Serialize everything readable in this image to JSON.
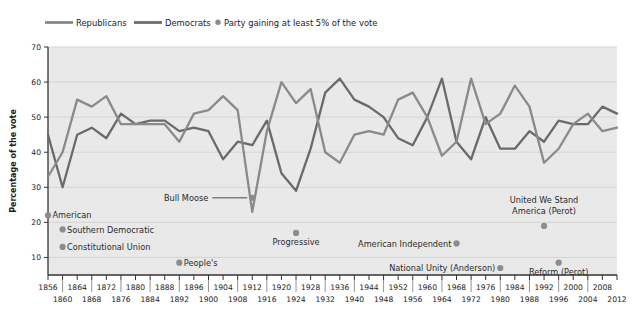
{
  "chart_data": {
    "type": "line",
    "title": "",
    "xlabel": "",
    "ylabel": "Percentage of the vote",
    "ylim": [
      5,
      70
    ],
    "yticks": [
      10,
      20,
      30,
      40,
      50,
      60,
      70
    ],
    "xlim": [
      1856,
      2012
    ],
    "grid": true,
    "legend_position": "top-left",
    "legend": [
      {
        "name": "Republicans",
        "kind": "line",
        "color": "#808080"
      },
      {
        "name": "Democrats",
        "kind": "line",
        "color": "#6e6e6e"
      },
      {
        "name": "Party gaining at least 5% of the vote",
        "kind": "dot",
        "color": "#8c8c8c"
      }
    ],
    "xticks_top": [
      1856,
      1864,
      1872,
      1880,
      1888,
      1896,
      1904,
      1912,
      1920,
      1928,
      1936,
      1944,
      1952,
      1960,
      1968,
      1976,
      1984,
      1992,
      2000,
      2008
    ],
    "xticks_bottom": [
      1860,
      1868,
      1876,
      1884,
      1892,
      1900,
      1908,
      1916,
      1924,
      1932,
      1940,
      1948,
      1956,
      1964,
      1972,
      1980,
      1988,
      1996,
      2004,
      2012
    ],
    "x": [
      1856,
      1860,
      1864,
      1868,
      1872,
      1876,
      1880,
      1884,
      1888,
      1892,
      1896,
      1900,
      1904,
      1908,
      1912,
      1916,
      1920,
      1924,
      1928,
      1932,
      1936,
      1940,
      1944,
      1948,
      1952,
      1956,
      1960,
      1964,
      1968,
      1972,
      1976,
      1980,
      1984,
      1988,
      1992,
      1996,
      2000,
      2004,
      2008,
      2012
    ],
    "series": [
      {
        "name": "Republicans",
        "color": "#8a8a8a",
        "values": [
          33,
          40,
          55,
          53,
          56,
          48,
          48,
          48,
          48,
          43,
          51,
          52,
          56,
          52,
          23,
          46,
          60,
          54,
          58,
          40,
          37,
          45,
          46,
          45,
          55,
          57,
          50,
          39,
          43,
          61,
          48,
          51,
          59,
          53,
          37,
          41,
          48,
          51,
          46,
          47
        ]
      },
      {
        "name": "Democrats",
        "color": "#6a6a6a",
        "values": [
          45,
          30,
          45,
          47,
          44,
          51,
          48,
          49,
          49,
          46,
          47,
          46,
          38,
          43,
          42,
          49,
          34,
          29,
          41,
          57,
          61,
          55,
          53,
          50,
          44,
          42,
          50,
          61,
          43,
          38,
          50,
          41,
          41,
          46,
          43,
          49,
          48,
          48,
          53,
          51
        ]
      }
    ],
    "third_party_points": [
      {
        "label": "American",
        "year": 1856,
        "value": 22,
        "label_side": "right"
      },
      {
        "label": "Southern Democratic",
        "year": 1860,
        "value": 18,
        "label_side": "right"
      },
      {
        "label": "Constitutional Union",
        "year": 1860,
        "value": 13,
        "label_side": "right"
      },
      {
        "label": "People's",
        "year": 1892,
        "value": 8.5,
        "label_side": "right"
      },
      {
        "label": "Bull Moose",
        "year": 1912,
        "value": 27,
        "label_side": "leader-left"
      },
      {
        "label": "Progressive",
        "year": 1924,
        "value": 17,
        "label_side": "below"
      },
      {
        "label": "American Independent",
        "year": 1968,
        "value": 14,
        "label_side": "left"
      },
      {
        "label": "National Unity (Anderson)",
        "year": 1980,
        "value": 7,
        "label_side": "left"
      },
      {
        "label": "United We Stand America (Perot)",
        "year": 1992,
        "value": 19,
        "label_side": "above"
      },
      {
        "label": "Reform (Perot)",
        "year": 1996,
        "value": 8.5,
        "label_side": "below"
      }
    ]
  },
  "colors": {
    "plot_background": "#e9e9e9",
    "grid": "#d2d2d2",
    "axis": "#333333",
    "republicans": "#8a8a8a",
    "democrats": "#6a6a6a",
    "dot": "#8c8c8c",
    "page_background": "#ffffff"
  }
}
